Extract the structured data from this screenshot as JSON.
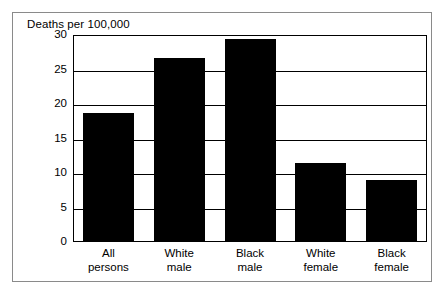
{
  "figure": {
    "title": "Deaths per 100,000",
    "border_color": "#8a8a8a",
    "bar_color": "#000000",
    "axis_color": "#000000",
    "background": "#ffffff"
  },
  "chart_data": {
    "type": "bar",
    "title": "Deaths per 100,000",
    "xlabel": "",
    "ylabel": "Deaths per 100,000",
    "categories": [
      "All persons",
      "White male",
      "Black male",
      "White female",
      "Black female"
    ],
    "category_lines": [
      [
        "All",
        "persons"
      ],
      [
        "White",
        "male"
      ],
      [
        "Black",
        "male"
      ],
      [
        "White",
        "female"
      ],
      [
        "Black",
        "female"
      ]
    ],
    "values": [
      18.7,
      26.7,
      29.4,
      11.5,
      9.0
    ],
    "ylim": [
      0,
      30
    ],
    "yticks": [
      0,
      5,
      10,
      15,
      20,
      25,
      30
    ],
    "ytick_labels": [
      "0",
      "5",
      "10",
      "15",
      "20",
      "25",
      "30"
    ],
    "grid": true,
    "grid_axis": "y",
    "legend": false,
    "series": [
      {
        "name": "Deaths per 100,000",
        "values": [
          18.7,
          26.7,
          29.4,
          11.5,
          9.0
        ]
      }
    ]
  }
}
